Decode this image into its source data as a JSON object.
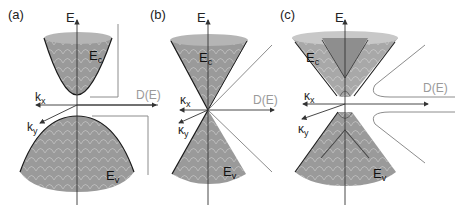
{
  "figure": {
    "colors": {
      "surface": "#9a9a9a",
      "surface_light": "#c8c8c8",
      "rim": "#b5b5b5",
      "edge": "#1a1a1a",
      "axis": "#333333",
      "dos_line": "#8c8c8c",
      "dos_label": "#9a9a9a",
      "mesh": "#e6e6e6"
    },
    "panels": [
      {
        "label": "(a)",
        "energy_axis": "E",
        "kx_label": "k",
        "kx_sub": "x",
        "ky_label": "k",
        "ky_sub": "y",
        "conduction_label": "E",
        "conduction_sub": "c",
        "valence_label": "E",
        "valence_sub": "v",
        "dos_label": "D(E)"
      },
      {
        "label": "(b)",
        "energy_axis": "E",
        "kx_label": "κ",
        "kx_sub": "x",
        "ky_label": "κ",
        "ky_sub": "y",
        "conduction_label": "E",
        "conduction_sub": "c",
        "valence_label": "E",
        "valence_sub": "v",
        "dos_label": "D(E)"
      },
      {
        "label": "(c)",
        "energy_axis": "E",
        "kx_label": "κ",
        "kx_sub": "x",
        "ky_label": "κ",
        "ky_sub": "y",
        "conduction_label": "E",
        "conduction_sub": "c",
        "valence_label": "E",
        "valence_sub": "v",
        "dos_label": "D(E)"
      }
    ]
  }
}
